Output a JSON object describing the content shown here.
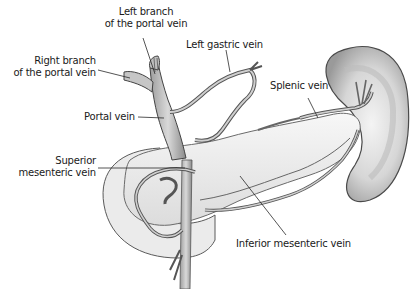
{
  "diagram": {
    "colors": {
      "background": "#ffffff",
      "vein_fill": "#c8c8c8",
      "vein_stroke": "#4a4a4a",
      "organ_fill": "#eeeeee",
      "organ_stroke": "#5a5a5a",
      "leader_line": "#2a2a2a",
      "label_text": "#1a1a1a"
    },
    "labels": {
      "left_branch_line1": "Left branch",
      "left_branch_line2": "of the portal vein",
      "right_branch_line1": "Right branch",
      "right_branch_line2": "of the portal vein",
      "left_gastric": "Left gastric vein",
      "splenic": "Splenic vein",
      "portal": "Portal vein",
      "superior_mesenteric_line1": "Superior",
      "superior_mesenteric_line2": "mesenteric vein",
      "inferior_mesenteric": "Inferior mesenteric vein"
    },
    "structures": [
      "portal-vein",
      "left-branch-portal-vein",
      "right-branch-portal-vein",
      "left-gastric-vein",
      "splenic-vein",
      "superior-mesenteric-vein",
      "inferior-mesenteric-vein",
      "spleen",
      "pancreas",
      "duodenum"
    ]
  }
}
